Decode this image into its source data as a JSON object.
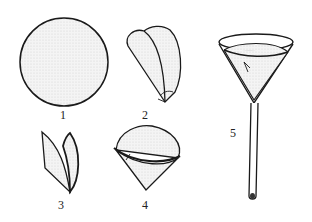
{
  "diagram": {
    "type": "procedure-illustration",
    "colors": {
      "stroke": "#1a1a1a",
      "fill": "#efefef",
      "background": "#ffffff"
    },
    "steps": [
      {
        "label": "1",
        "description": "circular filter paper"
      },
      {
        "label": "2",
        "description": "paper folded in half, then folded again"
      },
      {
        "label": "3",
        "description": "folded quarter opened"
      },
      {
        "label": "4",
        "description": "paper opened into a cone"
      },
      {
        "label": "5",
        "description": "cone placed into funnel"
      }
    ]
  }
}
